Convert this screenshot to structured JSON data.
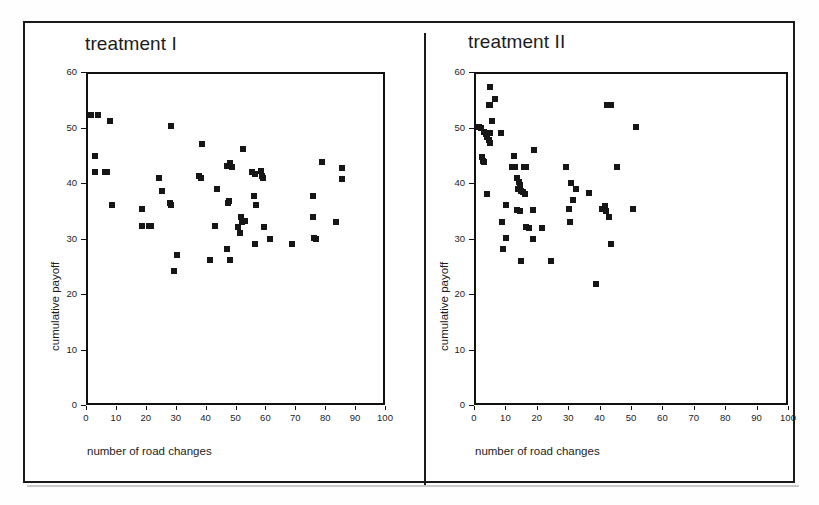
{
  "figure": {
    "panel_count": 2,
    "outer_border_color": "#1a1a1a",
    "marker_color": "#161616"
  },
  "axes_common": {
    "xlabel": "number of road changes",
    "ylabel": "cumulative payoff",
    "xticks": [
      "0",
      "10",
      "20",
      "30",
      "40",
      "50",
      "60",
      "70",
      "80",
      "90",
      "100"
    ],
    "yticks": [
      "0",
      "10",
      "20",
      "30",
      "40",
      "50",
      "60"
    ],
    "xlim": [
      0,
      100
    ],
    "ylim": [
      0,
      60
    ]
  },
  "panels": [
    {
      "id": "left",
      "title": "treatment I"
    },
    {
      "id": "right",
      "title": "treatment II"
    }
  ],
  "chart_data": [
    {
      "type": "scatter",
      "title": "treatment I",
      "xlabel": "number of road changes",
      "ylabel": "cumulative payoff",
      "xlim": [
        0,
        100
      ],
      "ylim": [
        0,
        60
      ],
      "xticks": [
        0,
        10,
        20,
        30,
        40,
        50,
        60,
        70,
        80,
        90,
        100
      ],
      "yticks": [
        0,
        10,
        20,
        30,
        40,
        50,
        60
      ],
      "grid": false,
      "legend": "none",
      "marker": "filled-square",
      "points": [
        [
          1,
          52.6
        ],
        [
          3.2,
          52.6
        ],
        [
          7.3,
          51.6
        ],
        [
          2.3,
          45.2
        ],
        [
          2.3,
          42.3
        ],
        [
          5.6,
          42.3
        ],
        [
          6.2,
          42.3
        ],
        [
          7.9,
          36.4
        ],
        [
          18.0,
          35.6
        ],
        [
          18.2,
          32.6
        ],
        [
          20.3,
          32.6
        ],
        [
          21.0,
          32.6
        ],
        [
          27.8,
          50.6
        ],
        [
          23.7,
          41.3
        ],
        [
          24.6,
          39.0
        ],
        [
          27.3,
          36.8
        ],
        [
          27.8,
          36.4
        ],
        [
          28.9,
          24.5
        ],
        [
          29.8,
          27.3
        ],
        [
          37.2,
          41.6
        ],
        [
          37.9,
          41.3
        ],
        [
          38.2,
          47.4
        ],
        [
          40.9,
          26.5
        ],
        [
          42.6,
          32.6
        ],
        [
          43.3,
          39.2
        ],
        [
          46.6,
          28.4
        ],
        [
          46.9,
          36.8
        ],
        [
          47.2,
          37.2
        ],
        [
          47.6,
          26.4
        ],
        [
          46.4,
          43.4
        ],
        [
          47.4,
          44.0
        ],
        [
          48.3,
          43.3
        ],
        [
          51.8,
          46.5
        ],
        [
          51.3,
          34.3
        ],
        [
          50.3,
          32.5
        ],
        [
          50.9,
          31.4
        ],
        [
          51.6,
          33.3
        ],
        [
          52.4,
          33.6
        ],
        [
          55.4,
          38.0
        ],
        [
          55.0,
          42.3
        ],
        [
          56.0,
          42.0
        ],
        [
          56.3,
          36.4
        ],
        [
          55.8,
          29.4
        ],
        [
          58.0,
          42.6
        ],
        [
          58.3,
          41.6
        ],
        [
          58.6,
          41.2
        ],
        [
          58.9,
          32.5
        ],
        [
          60.9,
          30.3
        ],
        [
          68.1,
          29.3
        ],
        [
          75.4,
          38.0
        ],
        [
          75.3,
          34.3
        ],
        [
          75.6,
          30.4
        ],
        [
          76.1,
          30.3
        ],
        [
          78.3,
          44.2
        ],
        [
          83.0,
          33.4
        ],
        [
          85.1,
          43.1
        ],
        [
          85.1,
          41.0
        ]
      ]
    },
    {
      "type": "scatter",
      "title": "treatment II",
      "xlabel": "number of road changes",
      "ylabel": "cumulative payoff",
      "xlim": [
        0,
        100
      ],
      "ylim": [
        0,
        60
      ],
      "xticks": [
        0,
        10,
        20,
        30,
        40,
        50,
        60,
        70,
        80,
        90,
        100
      ],
      "yticks": [
        0,
        10,
        20,
        30,
        40,
        50,
        60
      ],
      "grid": false,
      "legend": "none",
      "marker": "filled-square",
      "points": [
        [
          4.4,
          57.6
        ],
        [
          5.9,
          55.5
        ],
        [
          4.0,
          54.4
        ],
        [
          4.5,
          54.4
        ],
        [
          5.2,
          51.6
        ],
        [
          1.0,
          50.4
        ],
        [
          1.6,
          50.3
        ],
        [
          2.4,
          49.6
        ],
        [
          3.1,
          49.2
        ],
        [
          4.6,
          49.3
        ],
        [
          8.0,
          49.4
        ],
        [
          3.6,
          48.6
        ],
        [
          4.1,
          48.1
        ],
        [
          4.6,
          47.5
        ],
        [
          1.8,
          45.0
        ],
        [
          2.2,
          44.4
        ],
        [
          2.6,
          44.2
        ],
        [
          12.0,
          45.3
        ],
        [
          18.6,
          46.3
        ],
        [
          11.6,
          43.3
        ],
        [
          12.3,
          43.3
        ],
        [
          15.4,
          43.3
        ],
        [
          16.0,
          43.3
        ],
        [
          28.6,
          43.3
        ],
        [
          45.0,
          43.3
        ],
        [
          13.0,
          41.2
        ],
        [
          13.6,
          40.5
        ],
        [
          14.0,
          40.0
        ],
        [
          13.5,
          39.3
        ],
        [
          14.3,
          39.0
        ],
        [
          15.0,
          38.8
        ],
        [
          15.5,
          38.4
        ],
        [
          30.3,
          40.3
        ],
        [
          31.8,
          39.3
        ],
        [
          36.0,
          38.5
        ],
        [
          3.4,
          38.3
        ],
        [
          9.4,
          36.4
        ],
        [
          13.0,
          35.5
        ],
        [
          14.0,
          35.4
        ],
        [
          18.3,
          35.5
        ],
        [
          29.5,
          35.6
        ],
        [
          30.8,
          37.3
        ],
        [
          41.0,
          36.2
        ],
        [
          41.5,
          35.4
        ],
        [
          40.2,
          35.7
        ],
        [
          50.0,
          35.6
        ],
        [
          42.5,
          34.3
        ],
        [
          8.3,
          33.4
        ],
        [
          30.0,
          33.4
        ],
        [
          16.0,
          32.4
        ],
        [
          17.0,
          32.3
        ],
        [
          21.0,
          32.3
        ],
        [
          9.6,
          30.4
        ],
        [
          18.3,
          30.2
        ],
        [
          8.5,
          28.4
        ],
        [
          43.0,
          29.3
        ],
        [
          14.3,
          26.3
        ],
        [
          24.0,
          26.3
        ],
        [
          38.2,
          22.2
        ],
        [
          41.6,
          54.4
        ],
        [
          43.0,
          54.4
        ],
        [
          50.8,
          50.4
        ]
      ]
    }
  ]
}
